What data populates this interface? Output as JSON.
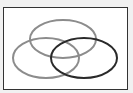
{
  "diagram": {
    "type": "venn",
    "sets": 3,
    "background": "#f1f1f1",
    "frame": {
      "fill": "#ffffff",
      "stroke": "#333333"
    },
    "ellipses": [
      {
        "name": "top",
        "cx": 63,
        "cy": 39,
        "rx": 33,
        "ry": 19,
        "stroke": "#8c8c8c"
      },
      {
        "name": "left",
        "cx": 46,
        "cy": 58,
        "rx": 33,
        "ry": 20,
        "stroke": "#8c8c8c"
      },
      {
        "name": "right",
        "cx": 84,
        "cy": 58,
        "rx": 33,
        "ry": 20,
        "stroke": "#2a2a2a"
      }
    ]
  }
}
